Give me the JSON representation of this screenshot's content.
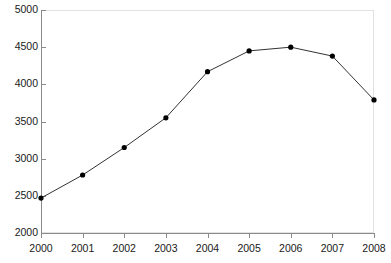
{
  "chart_data": {
    "type": "line",
    "title": "",
    "subtitle": "",
    "xlabel": "",
    "ylabel": "",
    "categories": [
      "2000",
      "2001",
      "2002",
      "2003",
      "2004",
      "2005",
      "2006",
      "2007",
      "2008"
    ],
    "x": [
      2000,
      2001,
      2002,
      2003,
      2004,
      2005,
      2006,
      2007,
      2008
    ],
    "values": [
      2470,
      2780,
      3150,
      3550,
      4170,
      4450,
      4500,
      4380,
      3790
    ],
    "series": [
      {
        "name": "series-1",
        "values": [
          2470,
          2780,
          3150,
          3550,
          4170,
          4450,
          4500,
          4380,
          3790
        ]
      }
    ],
    "xlim": [
      2000,
      2008
    ],
    "ylim": [
      2000,
      5000
    ],
    "y_ticks": [
      2000,
      2500,
      3000,
      3500,
      4000,
      4500,
      5000
    ],
    "y_tick_labels": [
      "2000",
      "2500",
      "3000",
      "3500",
      "4000",
      "4500",
      "5000"
    ],
    "x_ticks": [
      2000,
      2001,
      2002,
      2003,
      2004,
      2005,
      2006,
      2007,
      2008
    ],
    "x_tick_labels": [
      "2000",
      "2001",
      "2002",
      "2003",
      "2004",
      "2005",
      "2006",
      "2007",
      "2008"
    ],
    "grid": false,
    "legend": false,
    "legend_position": "none",
    "line_color": "#333333",
    "marker_color": "#000000",
    "marker_shape": "circle",
    "axis_color": "#8a8a8a",
    "frame_color": "#e2e2e2",
    "background_color": "#ffffff",
    "annotations": []
  }
}
